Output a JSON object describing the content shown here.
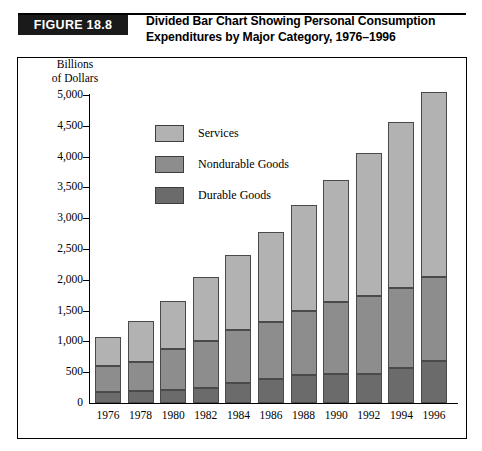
{
  "figure": {
    "badge": "FIGURE 18.8",
    "title_line1": "Divided Bar Chart Showing Personal Consumption",
    "title_line2": "Expenditures by Major Category, 1976–1996"
  },
  "axis_label_line1": "Billions",
  "axis_label_line2": "of Dollars",
  "legend": {
    "items": [
      {
        "label": "Services",
        "color": "#b2b2b2",
        "swatch_name": "legend-swatch-services"
      },
      {
        "label": "Nondurable Goods",
        "color": "#8d8d8d",
        "swatch_name": "legend-swatch-nondurable-goods"
      },
      {
        "label": "Durable Goods",
        "color": "#6b6b6b",
        "swatch_name": "legend-swatch-durable-goods"
      }
    ]
  },
  "chart_data": {
    "type": "bar",
    "subtype": "stacked",
    "title": "Divided Bar Chart Showing Personal Consumption Expenditures by Major Category, 1976–1996",
    "xlabel": "",
    "ylabel": "Billions of Dollars",
    "ylim": [
      0,
      5000
    ],
    "ytick_labels": [
      "5,000",
      "4,500",
      "4,000",
      "3,500",
      "3,000",
      "2,500",
      "2,000",
      "1,500",
      "1,000",
      "500",
      "0"
    ],
    "ytick_values": [
      5000,
      4500,
      4000,
      3500,
      3000,
      2500,
      2000,
      1500,
      1000,
      500,
      0
    ],
    "ytick_interval": 500,
    "grid": false,
    "legend_position": "inside-upper-left",
    "categories": [
      "1976",
      "1978",
      "1980",
      "1982",
      "1984",
      "1986",
      "1988",
      "1990",
      "1992",
      "1994",
      "1996"
    ],
    "series": [
      {
        "name": "Durable Goods",
        "color": "#6b6b6b",
        "values": [
          180,
          200,
          215,
          245,
          320,
          390,
          455,
          470,
          470,
          565,
          685
        ]
      },
      {
        "name": "Nondurable Goods",
        "color": "#8d8d8d",
        "values": [
          420,
          460,
          655,
          760,
          870,
          930,
          1045,
          1170,
          1275,
          1305,
          1365
        ]
      },
      {
        "name": "Services",
        "color": "#b2b2b2",
        "values": [
          470,
          670,
          790,
          1035,
          1220,
          1460,
          1710,
          1980,
          2315,
          2700,
          3000
        ]
      }
    ],
    "totals": [
      1070,
      1330,
      1660,
      2040,
      2410,
      2780,
      3210,
      3620,
      4060,
      4570,
      5050
    ]
  }
}
